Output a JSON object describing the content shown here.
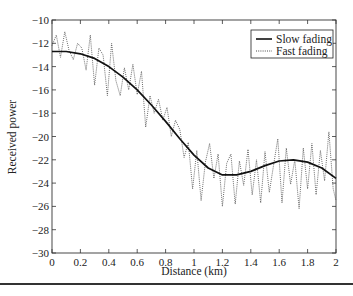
{
  "chart_data": {
    "type": "line",
    "title": "",
    "xlabel": "Distance (km)",
    "ylabel": "Received power",
    "xlim": [
      0,
      2
    ],
    "ylim": [
      -30,
      -10
    ],
    "xticks": [
      0,
      0.2,
      0.4,
      0.6,
      0.8,
      1,
      1.2,
      1.4,
      1.6,
      1.8,
      2
    ],
    "xtick_labels": [
      "0",
      "0.2",
      "0.4",
      "0.6",
      "0.8",
      "1",
      "1.2",
      "1.4",
      "1.6",
      "1.8",
      "2"
    ],
    "yticks": [
      -10,
      -12,
      -14,
      -16,
      -18,
      -20,
      -22,
      -24,
      -26,
      -28,
      -30
    ],
    "ytick_labels": [
      "−10",
      "−12",
      "−14",
      "−16",
      "−18",
      "−20",
      "−22",
      "−24",
      "−26",
      "−28",
      "−30"
    ],
    "grid": false,
    "legend_position": "upper right",
    "series": [
      {
        "name": "Slow fading",
        "style": "solid",
        "x": [
          0,
          0.1,
          0.2,
          0.3,
          0.4,
          0.5,
          0.6,
          0.7,
          0.8,
          0.9,
          1.0,
          1.1,
          1.2,
          1.3,
          1.4,
          1.5,
          1.6,
          1.7,
          1.8,
          1.9,
          2.0
        ],
        "values": [
          -12.7,
          -12.7,
          -12.9,
          -13.3,
          -14.0,
          -14.9,
          -16.0,
          -17.3,
          -18.7,
          -20.2,
          -21.6,
          -22.7,
          -23.3,
          -23.3,
          -23.0,
          -22.5,
          -22.1,
          -22.0,
          -22.2,
          -22.7,
          -23.6
        ]
      },
      {
        "name": "Fast fading",
        "style": "dotted",
        "x": [
          0,
          0.03,
          0.06,
          0.09,
          0.12,
          0.15,
          0.18,
          0.21,
          0.24,
          0.27,
          0.3,
          0.33,
          0.36,
          0.39,
          0.42,
          0.45,
          0.48,
          0.51,
          0.54,
          0.57,
          0.6,
          0.63,
          0.66,
          0.69,
          0.72,
          0.75,
          0.78,
          0.81,
          0.84,
          0.87,
          0.9,
          0.93,
          0.96,
          0.99,
          1.02,
          1.05,
          1.08,
          1.11,
          1.14,
          1.17,
          1.2,
          1.23,
          1.26,
          1.29,
          1.32,
          1.35,
          1.38,
          1.41,
          1.44,
          1.47,
          1.5,
          1.53,
          1.56,
          1.59,
          1.62,
          1.65,
          1.68,
          1.71,
          1.74,
          1.77,
          1.8,
          1.83,
          1.86,
          1.89,
          1.92,
          1.95,
          1.98,
          2.0
        ],
        "values": [
          -12.2,
          -11.3,
          -13.2,
          -11.0,
          -12.6,
          -13.4,
          -12.0,
          -12.4,
          -14.3,
          -11.3,
          -15.6,
          -12.4,
          -13.0,
          -16.5,
          -12.0,
          -15.2,
          -16.5,
          -14.1,
          -16.0,
          -13.8,
          -16.4,
          -14.4,
          -19.2,
          -16.5,
          -18.0,
          -16.8,
          -18.6,
          -17.5,
          -20.0,
          -18.6,
          -19.4,
          -21.8,
          -20.5,
          -24.5,
          -21.2,
          -25.5,
          -22.2,
          -20.6,
          -23.6,
          -21.5,
          -26.0,
          -22.3,
          -21.5,
          -25.8,
          -22.1,
          -24.2,
          -21.1,
          -25.0,
          -22.0,
          -25.7,
          -21.3,
          -24.8,
          -22.5,
          -20.2,
          -25.7,
          -21.0,
          -24.1,
          -22.0,
          -26.2,
          -21.0,
          -24.5,
          -20.6,
          -25.0,
          -21.2,
          -23.8,
          -19.6,
          -24.5,
          -25.5
        ]
      }
    ]
  },
  "legend": {
    "items": [
      {
        "label": "Slow fading",
        "style": "solid"
      },
      {
        "label": "Fast fading",
        "style": "dotted"
      }
    ]
  },
  "axes": {
    "xlabel": "Distance (km)",
    "ylabel": "Received power"
  }
}
